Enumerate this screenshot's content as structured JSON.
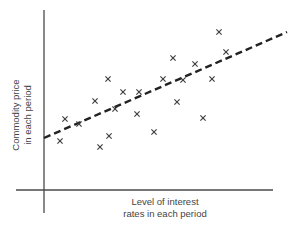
{
  "chart_data": {
    "type": "scatter",
    "title": "",
    "xlabel": "Level of interest rates in each period",
    "ylabel": "Commodity price in each period",
    "xlabel_lines": [
      "Level of interest",
      "rates in each period"
    ],
    "ylabel_lines": [
      "Commodity price",
      "in each period"
    ],
    "axis_ticks": "none",
    "grid": false,
    "legend": "none",
    "marker": "x",
    "points_pixel_space": [
      [
        60,
        141
      ],
      [
        65,
        119
      ],
      [
        79,
        124
      ],
      [
        95,
        101
      ],
      [
        100,
        147
      ],
      [
        108,
        79
      ],
      [
        109,
        136
      ],
      [
        115,
        109
      ],
      [
        123,
        92
      ],
      [
        137,
        114
      ],
      [
        139,
        92
      ],
      [
        154,
        132
      ],
      [
        163,
        79
      ],
      [
        173,
        58
      ],
      [
        177,
        102
      ],
      [
        183,
        80
      ],
      [
        195,
        64
      ],
      [
        203,
        118
      ],
      [
        212,
        79
      ],
      [
        219,
        32
      ],
      [
        226,
        52
      ]
    ],
    "points_relative": [
      {
        "x": 0.07,
        "y": 0.27
      },
      {
        "x": 0.09,
        "y": 0.39
      },
      {
        "x": 0.15,
        "y": 0.36
      },
      {
        "x": 0.21,
        "y": 0.49
      },
      {
        "x": 0.23,
        "y": 0.24
      },
      {
        "x": 0.26,
        "y": 0.61
      },
      {
        "x": 0.27,
        "y": 0.3
      },
      {
        "x": 0.29,
        "y": 0.45
      },
      {
        "x": 0.32,
        "y": 0.54
      },
      {
        "x": 0.37,
        "y": 0.42
      },
      {
        "x": 0.38,
        "y": 0.54
      },
      {
        "x": 0.44,
        "y": 0.32
      },
      {
        "x": 0.48,
        "y": 0.61
      },
      {
        "x": 0.51,
        "y": 0.73
      },
      {
        "x": 0.53,
        "y": 0.48
      },
      {
        "x": 0.55,
        "y": 0.61
      },
      {
        "x": 0.6,
        "y": 0.7
      },
      {
        "x": 0.63,
        "y": 0.4
      },
      {
        "x": 0.66,
        "y": 0.61
      },
      {
        "x": 0.69,
        "y": 0.87
      },
      {
        "x": 0.72,
        "y": 0.76
      }
    ],
    "trend_line": {
      "style": "dashed",
      "description": "Positive linear trend (line of best fit)",
      "start_pixel": [
        44,
        138
      ],
      "end_pixel": [
        287,
        32
      ]
    },
    "axes_pixel": {
      "origin": [
        44,
        190
      ],
      "x_axis": {
        "from": 16,
        "to": 273,
        "y": 190
      },
      "y_axis": {
        "from": 10,
        "to": 213,
        "x": 44
      }
    }
  },
  "colors": {
    "axis": "#4a4a4a",
    "marker": "#3a3a3a",
    "trend": "#222222",
    "text": "#444444"
  }
}
